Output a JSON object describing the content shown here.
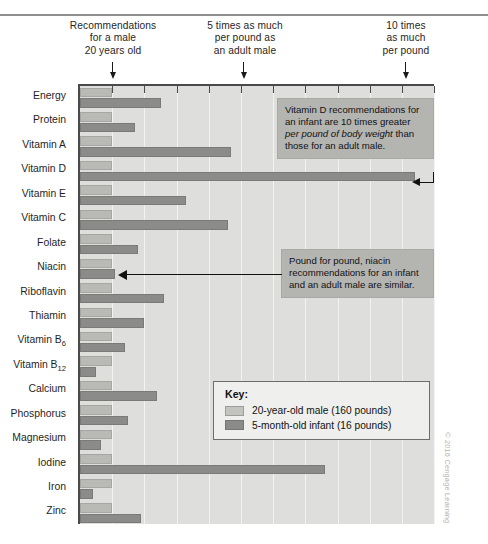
{
  "header": {
    "callouts": [
      "Recommendations\nfor a male\n20 years old",
      "5 times as much\nper pound as\nan adult male",
      "10 times\nas much\nper pound"
    ],
    "arrow_icon": "down-arrow-icon"
  },
  "annotations": {
    "vitamin_d": {
      "part1": "Vitamin D recommendations for an infant are 10 times greater ",
      "emphasis": "per pound of body weight",
      "part2": " than those for an adult male."
    },
    "niacin": "Pound for pound, niacin recommendations for an infant and an adult male are similar."
  },
  "key": {
    "title": "Key:",
    "entries": [
      {
        "label": "20-year-old male (160 pounds)",
        "color": "#c3c3c0"
      },
      {
        "label": "5-month-old infant (16 pounds)",
        "color": "#8b8b89"
      }
    ]
  },
  "credit": "© 2016 Cengage Learning",
  "colors": {
    "plot_background": "#dededc",
    "light_bar": "#b9b9b6",
    "dark_bar": "#8b8b89",
    "note_background": "#b4b4b1",
    "axis": "#4a4a4a"
  },
  "chart_data": {
    "type": "bar",
    "orientation": "horizontal",
    "title": "",
    "xlabel": "Multiple of adult male recommendation per pound",
    "ylabel": "",
    "xlim": [
      0,
      11.1
    ],
    "xticks": [
      1,
      2,
      3,
      4,
      5,
      6,
      7,
      8,
      9,
      10,
      11
    ],
    "grid": true,
    "legend_position": "inside-lower-right",
    "categories": [
      "Energy",
      "Protein",
      "Vitamin A",
      "Vitamin D",
      "Vitamin E",
      "Vitamin C",
      "Folate",
      "Niacin",
      "Riboflavin",
      "Thiamin",
      "Vitamin B6",
      "Vitamin B12",
      "Calcium",
      "Phosphorus",
      "Magnesium",
      "Iodine",
      "Iron",
      "Zinc"
    ],
    "series": [
      {
        "name": "20-year-old male (160 pounds)",
        "color": "#b9b9b6",
        "values": [
          1,
          1,
          1,
          1,
          1,
          1,
          1,
          1,
          1,
          1,
          1,
          1,
          1,
          1,
          1,
          1,
          1,
          1
        ]
      },
      {
        "name": "5-month-old infant (16 pounds)",
        "color": "#8b8b89",
        "values": [
          2.5,
          1.7,
          4.7,
          10.4,
          3.3,
          4.6,
          1.8,
          1.1,
          2.6,
          2.0,
          1.4,
          0.5,
          2.4,
          1.5,
          0.65,
          7.6,
          0.4,
          1.9
        ]
      }
    ]
  }
}
